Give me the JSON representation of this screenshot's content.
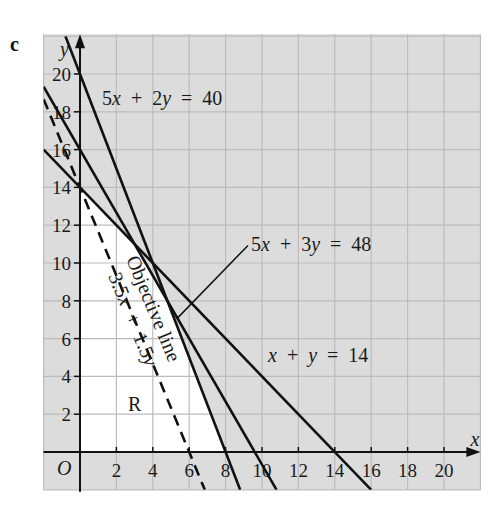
{
  "part_label": "c",
  "chart_data": {
    "type": "line",
    "title": "",
    "xlabel": "x",
    "ylabel": "y",
    "origin_label": "O",
    "xlim": [
      -2,
      22
    ],
    "ylim": [
      -2,
      22
    ],
    "grid": true,
    "grid_step": 2,
    "x_ticks": [
      2,
      4,
      6,
      8,
      10,
      12,
      14,
      16,
      18,
      20
    ],
    "y_ticks": [
      2,
      4,
      6,
      8,
      10,
      12,
      14,
      16,
      18,
      20
    ],
    "x_tick_labels": [
      "2",
      "4",
      "6",
      "8",
      "10",
      "12",
      "14",
      "16",
      "18",
      "20"
    ],
    "y_tick_labels": [
      "2",
      "4",
      "6",
      "8",
      "10",
      "12",
      "14",
      "16",
      "18",
      "20"
    ],
    "series": [
      {
        "name": "5x + 2y = 40",
        "a": 5,
        "b": 2,
        "c": 40,
        "style": "solid",
        "points": [
          [
            -0.8,
            22
          ],
          [
            8.8,
            -2
          ]
        ],
        "intercepts": {
          "x": 8,
          "y": 20
        }
      },
      {
        "name": "5x + 3y = 48",
        "a": 5,
        "b": 3,
        "c": 48,
        "style": "solid",
        "points": [
          [
            -2,
            19.333
          ],
          [
            10.8,
            -2
          ]
        ],
        "intercepts": {
          "x": 9.6,
          "y": 16
        }
      },
      {
        "name": "x + y = 14",
        "a": 1,
        "b": 1,
        "c": 14,
        "style": "solid",
        "points": [
          [
            -2,
            16
          ],
          [
            16,
            -2
          ]
        ],
        "intercepts": {
          "x": 14,
          "y": 14
        }
      },
      {
        "name": "Objective line 3.5x + 1.5y",
        "a": 3.5,
        "b": 1.5,
        "c": 21,
        "style": "dashed",
        "points": [
          [
            -2,
            18.667
          ],
          [
            6.857,
            -2
          ]
        ],
        "intercepts": {
          "x": 6,
          "y": 14
        }
      }
    ],
    "feasible_region": {
      "label": "R",
      "vertices": [
        [
          0,
          0
        ],
        [
          8,
          0
        ],
        [
          4.8,
          8
        ],
        [
          3,
          11
        ],
        [
          0,
          14
        ]
      ],
      "fill": "#ffffff"
    },
    "annotations": [
      {
        "text": "5x + 2y = 40",
        "position": [
          1.2,
          18.6
        ]
      },
      {
        "text": "5x + 3y = 48",
        "position": [
          9.4,
          10.8
        ],
        "leader_from": [
          5.34,
          7.07
        ],
        "leader_to": [
          9.23,
          10.93
        ]
      },
      {
        "text": "x + y = 14",
        "position": [
          10.3,
          4.8
        ]
      },
      {
        "text": "Objective line",
        "along": "dashed line"
      },
      {
        "text": "3.5x + 1.5y",
        "along": "dashed line"
      },
      {
        "text": "R",
        "position": [
          2.7,
          2.3
        ]
      }
    ]
  },
  "colors": {
    "grid_background": "#dcdcdc",
    "grid_line": "#bcbcbc",
    "region_fill": "#ffffff",
    "line": "#111111",
    "text": "#1a1a1a"
  }
}
